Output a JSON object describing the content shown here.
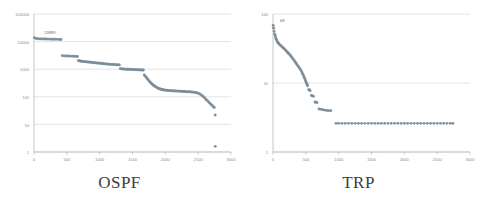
{
  "figure": {
    "background": "#ffffff",
    "marker_color": "#7a8c99",
    "gridline_color": "#d9d9d9",
    "axis_color": "#b0b0b0",
    "tick_label_color": "#8a8a8a",
    "title_color": "#3b3b3b"
  },
  "panels": [
    {
      "key": "ospf",
      "title": "OSPF",
      "annotation": "13889"
    },
    {
      "key": "trp",
      "title": "TRP",
      "annotation": "68"
    }
  ],
  "chart_data": [
    {
      "type": "scatter",
      "title": "OSPF",
      "xlabel": "",
      "ylabel": "",
      "yscale": "log",
      "xscale": "linear",
      "xlim": [
        0,
        3000
      ],
      "ylim": [
        1,
        100000
      ],
      "xticks": [
        0,
        500,
        1000,
        1500,
        2000,
        2500,
        3000
      ],
      "xticklabels": [
        "0",
        "500",
        "1000",
        "1500",
        "2000",
        "2500",
        "3000"
      ],
      "yticks": [
        1,
        10,
        100,
        1000,
        10000,
        100000
      ],
      "yticklabels": [
        "1",
        "10",
        "100",
        "1000",
        "10000",
        "100000"
      ],
      "grid": true,
      "legend": null,
      "annotations": [
        {
          "text": "13889",
          "x": 120,
          "y": 13889
        }
      ],
      "series": [
        {
          "name": "ospf",
          "marker": "circle",
          "color": "#7a8c99",
          "points": [
            [
              5,
              13889
            ],
            [
              30,
              12900
            ],
            [
              60,
              12700
            ],
            [
              90,
              12600
            ],
            [
              120,
              12500
            ],
            [
              150,
              12400
            ],
            [
              180,
              12350
            ],
            [
              210,
              12300
            ],
            [
              240,
              12250
            ],
            [
              270,
              12200
            ],
            [
              300,
              12150
            ],
            [
              330,
              12100
            ],
            [
              360,
              12050
            ],
            [
              390,
              12000
            ],
            [
              410,
              11950
            ],
            [
              430,
              3100
            ],
            [
              460,
              3050
            ],
            [
              490,
              3020
            ],
            [
              520,
              3000
            ],
            [
              550,
              2980
            ],
            [
              580,
              2960
            ],
            [
              610,
              2940
            ],
            [
              640,
              2920
            ],
            [
              660,
              2900
            ],
            [
              675,
              2050
            ],
            [
              690,
              2000
            ],
            [
              705,
              1970
            ],
            [
              720,
              1950
            ],
            [
              740,
              1920
            ],
            [
              760,
              1900
            ],
            [
              780,
              1870
            ],
            [
              800,
              1850
            ],
            [
              820,
              1820
            ],
            [
              840,
              1800
            ],
            [
              860,
              1780
            ],
            [
              880,
              1760
            ],
            [
              900,
              1740
            ],
            [
              920,
              1720
            ],
            [
              940,
              1700
            ],
            [
              960,
              1680
            ],
            [
              980,
              1660
            ],
            [
              1000,
              1640
            ],
            [
              1020,
              1620
            ],
            [
              1040,
              1600
            ],
            [
              1060,
              1580
            ],
            [
              1080,
              1560
            ],
            [
              1100,
              1545
            ],
            [
              1120,
              1530
            ],
            [
              1140,
              1515
            ],
            [
              1160,
              1500
            ],
            [
              1180,
              1490
            ],
            [
              1200,
              1480
            ],
            [
              1220,
              1470
            ],
            [
              1240,
              1460
            ],
            [
              1260,
              1450
            ],
            [
              1280,
              1440
            ],
            [
              1300,
              1430
            ],
            [
              1315,
              1050
            ],
            [
              1330,
              1030
            ],
            [
              1350,
              1020
            ],
            [
              1370,
              1010
            ],
            [
              1390,
              1000
            ],
            [
              1410,
              995
            ],
            [
              1430,
              990
            ],
            [
              1450,
              985
            ],
            [
              1470,
              980
            ],
            [
              1490,
              975
            ],
            [
              1510,
              970
            ],
            [
              1530,
              965
            ],
            [
              1550,
              960
            ],
            [
              1570,
              955
            ],
            [
              1590,
              950
            ],
            [
              1610,
              945
            ],
            [
              1630,
              940
            ],
            [
              1650,
              935
            ],
            [
              1665,
              930
            ],
            [
              1680,
              620
            ],
            [
              1695,
              560
            ],
            [
              1710,
              500
            ],
            [
              1725,
              450
            ],
            [
              1740,
              410
            ],
            [
              1755,
              370
            ],
            [
              1770,
              340
            ],
            [
              1785,
              310
            ],
            [
              1800,
              285
            ],
            [
              1815,
              265
            ],
            [
              1830,
              250
            ],
            [
              1845,
              235
            ],
            [
              1860,
              225
            ],
            [
              1875,
              215
            ],
            [
              1890,
              205
            ],
            [
              1905,
              198
            ],
            [
              1920,
              192
            ],
            [
              1935,
              187
            ],
            [
              1950,
              183
            ],
            [
              1965,
              180
            ],
            [
              1980,
              177
            ],
            [
              2000,
              174
            ],
            [
              2020,
              172
            ],
            [
              2040,
              170
            ],
            [
              2060,
              168
            ],
            [
              2080,
              166
            ],
            [
              2100,
              165
            ],
            [
              2120,
              164
            ],
            [
              2140,
              163
            ],
            [
              2160,
              162
            ],
            [
              2180,
              161
            ],
            [
              2200,
              160
            ],
            [
              2220,
              159
            ],
            [
              2240,
              158
            ],
            [
              2260,
              157
            ],
            [
              2280,
              156
            ],
            [
              2300,
              155
            ],
            [
              2320,
              154
            ],
            [
              2340,
              153
            ],
            [
              2360,
              152
            ],
            [
              2380,
              151
            ],
            [
              2400,
              150
            ],
            [
              2420,
              148
            ],
            [
              2440,
              146
            ],
            [
              2460,
              143
            ],
            [
              2480,
              139
            ],
            [
              2500,
              134
            ],
            [
              2520,
              128
            ],
            [
              2540,
              120
            ],
            [
              2560,
              110
            ],
            [
              2580,
              100
            ],
            [
              2600,
              90
            ],
            [
              2620,
              80
            ],
            [
              2640,
              72
            ],
            [
              2660,
              65
            ],
            [
              2680,
              58
            ],
            [
              2700,
              52
            ],
            [
              2715,
              48
            ],
            [
              2730,
              44
            ],
            [
              2745,
              41
            ],
            [
              2760,
              22
            ],
            [
              2760,
              1.6
            ]
          ]
        }
      ]
    },
    {
      "type": "scatter",
      "title": "TRP",
      "xlabel": "",
      "ylabel": "",
      "yscale": "log",
      "xscale": "linear",
      "xlim": [
        0,
        3000
      ],
      "ylim": [
        1,
        100
      ],
      "xticks": [
        0,
        500,
        1000,
        1500,
        2000,
        2500,
        3000
      ],
      "xticklabels": [
        "0",
        "500",
        "1000",
        "1500",
        "2000",
        "2500",
        "3000"
      ],
      "yticks": [
        1,
        10,
        100
      ],
      "yticklabels": [
        "1",
        "10",
        "100"
      ],
      "grid": true,
      "legend": null,
      "annotations": [
        {
          "text": "68",
          "x": 75,
          "y": 68
        }
      ],
      "series": [
        {
          "name": "trp",
          "marker": "circle",
          "color": "#7a8c99",
          "points": [
            [
              3,
              68
            ],
            [
              10,
              62
            ],
            [
              18,
              56
            ],
            [
              26,
              51
            ],
            [
              34,
              48
            ],
            [
              42,
              45
            ],
            [
              50,
              43
            ],
            [
              60,
              41
            ],
            [
              70,
              39
            ],
            [
              80,
              38
            ],
            [
              90,
              37
            ],
            [
              100,
              36
            ],
            [
              115,
              35
            ],
            [
              130,
              34
            ],
            [
              145,
              33
            ],
            [
              160,
              32
            ],
            [
              175,
              31
            ],
            [
              190,
              30
            ],
            [
              205,
              29
            ],
            [
              220,
              28
            ],
            [
              235,
              27
            ],
            [
              250,
              26
            ],
            [
              265,
              25
            ],
            [
              280,
              24
            ],
            [
              295,
              23
            ],
            [
              310,
              22
            ],
            [
              325,
              21
            ],
            [
              340,
              20
            ],
            [
              355,
              19
            ],
            [
              370,
              18.2
            ],
            [
              385,
              17.4
            ],
            [
              400,
              16.6
            ],
            [
              415,
              15.8
            ],
            [
              430,
              15
            ],
            [
              442,
              14.2
            ],
            [
              454,
              13.4
            ],
            [
              466,
              12.6
            ],
            [
              476,
              12
            ],
            [
              486,
              11.4
            ],
            [
              495,
              10.8
            ],
            [
              503,
              10.3
            ],
            [
              511,
              9.9
            ],
            [
              519,
              9.5
            ],
            [
              527,
              9.1
            ],
            [
              545,
              8.0
            ],
            [
              555,
              7.9
            ],
            [
              565,
              7.8
            ],
            [
              585,
              6.6
            ],
            [
              600,
              6.5
            ],
            [
              615,
              6.4
            ],
            [
              640,
              5.3
            ],
            [
              655,
              5.25
            ],
            [
              670,
              5.2
            ],
            [
              700,
              4.2
            ],
            [
              730,
              4.15
            ],
            [
              760,
              4.1
            ],
            [
              790,
              4.05
            ],
            [
              820,
              4.0
            ],
            [
              850,
              3.98
            ],
            [
              880,
              3.96
            ],
            [
              960,
              2.6
            ],
            [
              1000,
              2.6
            ],
            [
              1050,
              2.6
            ],
            [
              1100,
              2.6
            ],
            [
              1150,
              2.6
            ],
            [
              1200,
              2.6
            ],
            [
              1250,
              2.6
            ],
            [
              1300,
              2.6
            ],
            [
              1350,
              2.6
            ],
            [
              1400,
              2.6
            ],
            [
              1450,
              2.6
            ],
            [
              1500,
              2.6
            ],
            [
              1550,
              2.6
            ],
            [
              1600,
              2.6
            ],
            [
              1650,
              2.6
            ],
            [
              1700,
              2.6
            ],
            [
              1750,
              2.6
            ],
            [
              1800,
              2.6
            ],
            [
              1850,
              2.6
            ],
            [
              1900,
              2.6
            ],
            [
              1950,
              2.6
            ],
            [
              2000,
              2.6
            ],
            [
              2050,
              2.6
            ],
            [
              2100,
              2.6
            ],
            [
              2150,
              2.6
            ],
            [
              2200,
              2.6
            ],
            [
              2250,
              2.6
            ],
            [
              2300,
              2.6
            ],
            [
              2350,
              2.6
            ],
            [
              2400,
              2.6
            ],
            [
              2450,
              2.6
            ],
            [
              2500,
              2.6
            ],
            [
              2550,
              2.6
            ],
            [
              2600,
              2.6
            ],
            [
              2650,
              2.6
            ],
            [
              2700,
              2.6
            ],
            [
              2740,
              2.6
            ]
          ]
        }
      ]
    }
  ]
}
